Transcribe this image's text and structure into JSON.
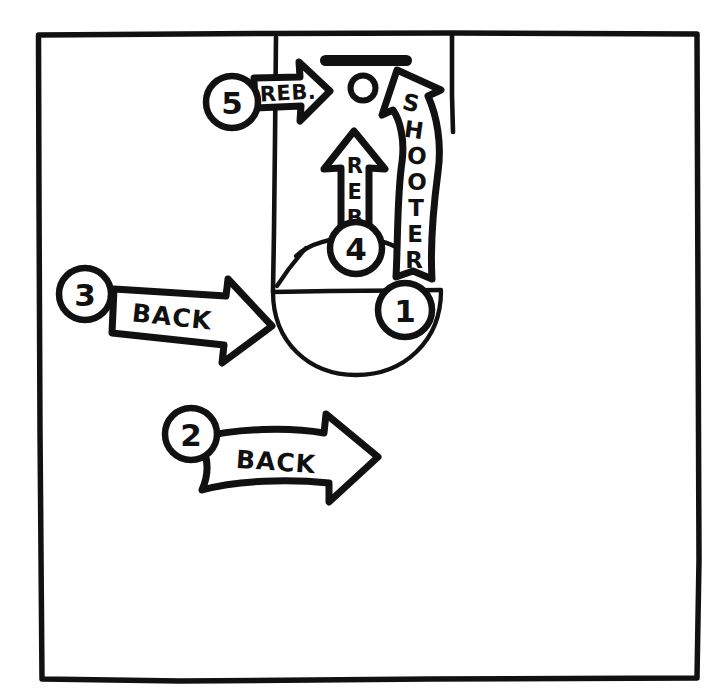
{
  "page": {
    "background_color": "#ffffff",
    "ink_color": "#111111",
    "width": 711,
    "height": 696
  },
  "court": {
    "frame_label": "court-frame",
    "elements": [
      {
        "name": "baseline",
        "label": "Baseline"
      },
      {
        "name": "lane-left-line",
        "label": "Lane line (left)"
      },
      {
        "name": "lane-right-line",
        "label": "Lane line (right)"
      },
      {
        "name": "free-throw-line",
        "label": "Free throw line"
      },
      {
        "name": "free-throw-circle",
        "label": "Free throw circle"
      },
      {
        "name": "backboard",
        "label": "Backboard"
      },
      {
        "name": "hoop",
        "label": "Hoop"
      }
    ]
  },
  "markers": [
    {
      "id": "marker-1",
      "number": "1",
      "describes": "SHOOTER"
    },
    {
      "id": "marker-2",
      "number": "2",
      "describes": "BACK"
    },
    {
      "id": "marker-3",
      "number": "3",
      "describes": "BACK"
    },
    {
      "id": "marker-4",
      "number": "4",
      "describes": "REB."
    },
    {
      "id": "marker-5",
      "number": "5",
      "describes": "REB."
    }
  ],
  "arrows": [
    {
      "id": "arrow-shooter",
      "label": "SHOOTER",
      "letters": [
        "S",
        "H",
        "O",
        "O",
        "T",
        "E",
        "R"
      ],
      "direction": "curved-up",
      "marker": "1"
    },
    {
      "id": "arrow-back-lower",
      "label": "BACK",
      "direction": "right-curved",
      "marker": "2"
    },
    {
      "id": "arrow-back-upper",
      "label": "BACK",
      "direction": "right-down",
      "marker": "3"
    },
    {
      "id": "arrow-reb-vertical",
      "label": "REB.",
      "letters": [
        "R",
        "E",
        "B",
        "."
      ],
      "direction": "up",
      "marker": "4"
    },
    {
      "id": "arrow-reb-horizontal",
      "label": "REB.",
      "direction": "right",
      "marker": "5"
    }
  ]
}
